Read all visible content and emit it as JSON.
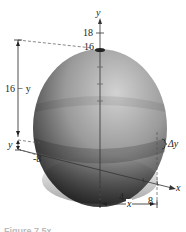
{
  "figure": {
    "type": "volume-of-sphere-disk-slice",
    "axis_labels": {
      "y": "y",
      "x": "x"
    },
    "y_ticks": [
      "18",
      "16"
    ],
    "x_ticks": [
      "-8",
      "4",
      "8"
    ],
    "dimension_labels": {
      "top_segment": "16 − y",
      "bottom_segment": "y",
      "slice_thickness": "Δy",
      "radius": "x"
    },
    "colors": {
      "sphere_light": "#bdbdbd",
      "sphere_dark": "#1e1e1e",
      "lines": "#333333"
    },
    "caption_partial": "Figure 7.5x"
  }
}
